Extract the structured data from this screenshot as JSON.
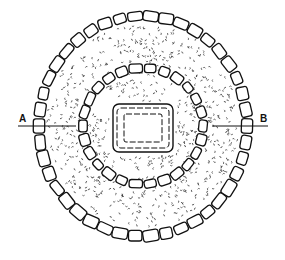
{
  "diagram": {
    "type": "archaeological-plan",
    "colors": {
      "ink": "#111111",
      "fill": "#ffffff",
      "stipple": "#333333"
    },
    "center": {
      "x": 143,
      "y": 126
    },
    "outer_ring": {
      "rx": 104,
      "ry": 110,
      "stone_count": 42
    },
    "inner_ring": {
      "rx": 60,
      "ry": 58,
      "stone_count": 26
    },
    "cist": {
      "x": 113,
      "y": 104,
      "width": 60,
      "height": 48
    },
    "section_line": {
      "y": 126,
      "left": {
        "label": "A",
        "x1": 18,
        "x2": 76
      },
      "right": {
        "label": "B",
        "x1": 212,
        "x2": 268
      }
    }
  }
}
